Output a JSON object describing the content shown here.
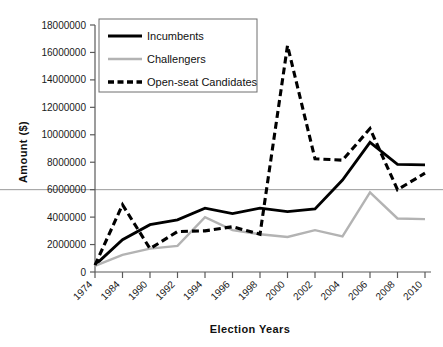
{
  "chart_data": {
    "type": "line",
    "title": "",
    "xlabel": "Election Years",
    "ylabel": "Amount ($)",
    "categories": [
      "1974",
      "1984",
      "1990",
      "1992",
      "1994",
      "1996",
      "1998",
      "2000",
      "2002",
      "2004",
      "2006",
      "2008",
      "2010"
    ],
    "ylim": [
      0,
      18000000
    ],
    "ytick_values": [
      0,
      2000000,
      4000000,
      6000000,
      8000000,
      10000000,
      12000000,
      14000000,
      16000000,
      18000000
    ],
    "ytick_labels": [
      "0",
      "2000000",
      "4000000",
      "6000000",
      "8000000",
      "10000000",
      "12000000",
      "14000000",
      "16000000",
      "18000000"
    ],
    "grid": "single horizontal gridline at 6000000",
    "gridline_values": [
      6000000
    ],
    "legend_position": "top-left inside plot",
    "series": [
      {
        "name": "Incumbents",
        "style": "solid",
        "color": "#000000",
        "values": [
          500000,
          2350000,
          3450000,
          3800000,
          4650000,
          4250000,
          4650000,
          4400000,
          4600000,
          6700000,
          9450000,
          7850000,
          7800000
        ]
      },
      {
        "name": "Challengers",
        "style": "solid",
        "color": "#b3b3b3",
        "values": [
          450000,
          1250000,
          1700000,
          1900000,
          4000000,
          3050000,
          2750000,
          2550000,
          3050000,
          2600000,
          5800000,
          3900000,
          3850000
        ]
      },
      {
        "name": "Open-seat Candidates",
        "style": "dashed",
        "color": "#000000",
        "values": [
          500000,
          4900000,
          1700000,
          2950000,
          3000000,
          3300000,
          2750000,
          16500000,
          8250000,
          8150000,
          10450000,
          6000000,
          7200000
        ]
      }
    ]
  },
  "legend": {
    "entries": [
      {
        "label": "Incumbents"
      },
      {
        "label": "Challengers"
      },
      {
        "label": "Open-seat Candidates"
      }
    ]
  },
  "axes": {
    "x_title": "Election Years",
    "y_title": "Amount ($)"
  }
}
